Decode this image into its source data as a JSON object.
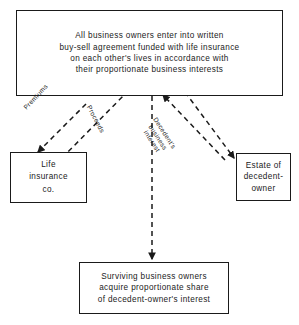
{
  "diagram": {
    "title": "Buy-sell agreement funded with life insurance",
    "nodes": {
      "agreement": {
        "text": "All business owners enter into written\nbuy-sell agreement funded with life insurance\non each other's lives in accordance with\ntheir proportionate business interests"
      },
      "insurer": {
        "text": "Life\ninsurance\nco."
      },
      "estate": {
        "text": "Estate of\ndecedent-\nowner"
      },
      "survivors": {
        "text": "Surviving business owners\nacquire proportionate share\nof decedent-owner's interest"
      }
    },
    "edge_labels": {
      "premiums": "Premiums",
      "proceeds": "Proceeds",
      "decedent_interest": "Decedent's\nbusiness\ninterest"
    },
    "style": {
      "stroke": "#1a1a1a",
      "background": "#ffffff",
      "line_style": "dashed"
    }
  }
}
